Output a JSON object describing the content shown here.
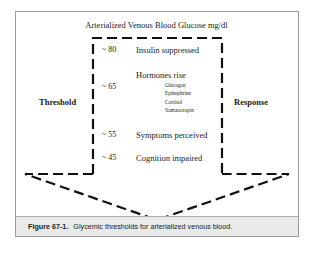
{
  "diagram": {
    "title": "Arterialized Venous Blood Glucose mg/dl",
    "left_label": "Threshold",
    "right_label": "Response",
    "levels": [
      {
        "value": "~ 80",
        "label": "Insulin suppressed"
      },
      {
        "value": "~ 65",
        "label": "Hormones rise",
        "sub_items": [
          "Glucagon",
          "Epinephrine",
          "Cortisol",
          "Somatotropin"
        ]
      },
      {
        "value": "~ 55",
        "label": "Symptoms perceived"
      },
      {
        "value": "~ 45",
        "label": "Cognition impaired"
      }
    ],
    "shape": "dashed-down-arrow"
  },
  "caption": {
    "figure_number": "Figure 67-1.",
    "text": "Glycemic thresholds for arterialized venous blood."
  }
}
